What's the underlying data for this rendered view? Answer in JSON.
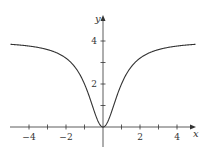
{
  "chart_data": {
    "type": "line",
    "title": "",
    "xlabel": "x",
    "ylabel": "y",
    "xlim": [
      -5,
      5
    ],
    "ylim": [
      0,
      5
    ],
    "grid": false,
    "x_ticks": [
      -4,
      -3,
      -2,
      -1,
      0,
      1,
      2,
      3,
      4
    ],
    "x_tick_labels": [
      "-4",
      "-2",
      "2",
      "4"
    ],
    "y_ticks": [
      1,
      2,
      3,
      4
    ],
    "y_tick_labels": [
      "2",
      "4"
    ],
    "series": [
      {
        "name": "y = 4x^2/(x^2+1)",
        "x": [
          -5,
          -4,
          -3,
          -2,
          -1.5,
          -1,
          -0.5,
          0,
          0.5,
          1,
          1.5,
          2,
          3,
          4,
          5
        ],
        "values": [
          3.85,
          3.76,
          3.6,
          3.2,
          2.77,
          2.0,
          0.8,
          0,
          0.8,
          2.0,
          2.77,
          3.2,
          3.6,
          3.76,
          3.85
        ]
      }
    ],
    "asymptote": 4
  },
  "labels": {
    "x_axis": "x",
    "y_axis": "y",
    "x_neg4": "−4",
    "x_neg2": "−2",
    "x_2": "2",
    "x_4": "4",
    "y_2": "2",
    "y_4": "4"
  },
  "colors": {
    "curve": "#333333",
    "axis": "#333333"
  }
}
